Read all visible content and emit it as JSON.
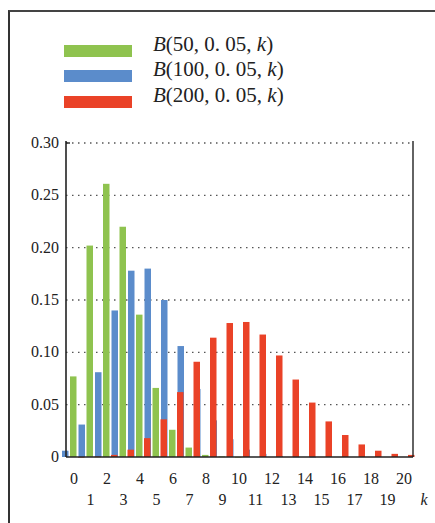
{
  "legend": {
    "items": [
      {
        "label_prefix": "B",
        "label_args": "(50, 0. 05, ",
        "label_var": "k",
        "label_suffix": ")",
        "color": "#8fc34f"
      },
      {
        "label_prefix": "B",
        "label_args": "(100, 0. 05, ",
        "label_var": "k",
        "label_suffix": ")",
        "color": "#5b8ccb"
      },
      {
        "label_prefix": "B",
        "label_args": "(200, 0. 05, ",
        "label_var": "k",
        "label_suffix": ")",
        "color": "#ea4227"
      }
    ]
  },
  "chart_data": {
    "type": "bar",
    "title": "",
    "xlabel": "k",
    "ylabel": "",
    "ylim": [
      0,
      0.3
    ],
    "grid": "horizontal dotted",
    "legend_position": "top-left, above plot",
    "categories": [
      0,
      1,
      2,
      3,
      4,
      5,
      6,
      7,
      8,
      9,
      10,
      11,
      12,
      13,
      14,
      15,
      16,
      17,
      18,
      19,
      20
    ],
    "x_tick_labels_row1": [
      "0",
      "2",
      "4",
      "6",
      "8",
      "10",
      "12",
      "14",
      "16",
      "18",
      "20"
    ],
    "x_tick_labels_row2": [
      "1",
      "3",
      "5",
      "7",
      "9",
      "11",
      "13",
      "15",
      "17",
      "19"
    ],
    "y_tick_labels": [
      "0",
      "0.05",
      "0.10",
      "0.15",
      "0.20",
      "0.25",
      "0.30"
    ],
    "series": [
      {
        "name": "B(50, 0.05, k)",
        "color": "#8fc34f",
        "values": [
          0.077,
          0.202,
          0.261,
          0.22,
          0.136,
          0.066,
          0.026,
          0.009,
          0.002,
          0.0005,
          0.0001,
          0,
          0,
          0,
          0,
          0,
          0,
          0,
          0,
          0,
          0
        ]
      },
      {
        "name": "B(100, 0.05, k)",
        "color": "#5b8ccb",
        "values": [
          0.006,
          0.031,
          0.081,
          0.14,
          0.178,
          0.18,
          0.15,
          0.106,
          0.065,
          0.035,
          0.017,
          0.007,
          0.003,
          0.001,
          0.0003,
          0.0001,
          0,
          0,
          0,
          0,
          0
        ]
      },
      {
        "name": "B(200, 0.05, k)",
        "color": "#ea4227",
        "values": [
          4e-05,
          0.0004,
          0.002,
          0.007,
          0.018,
          0.036,
          0.062,
          0.091,
          0.114,
          0.128,
          0.129,
          0.117,
          0.097,
          0.074,
          0.052,
          0.034,
          0.021,
          0.012,
          0.006,
          0.003,
          0.002
        ]
      }
    ]
  }
}
